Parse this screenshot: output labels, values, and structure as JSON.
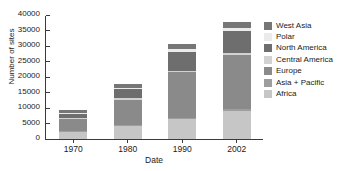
{
  "chart_data": {
    "type": "bar",
    "subtype": "stacked-bar",
    "title": "",
    "xlabel": "Date",
    "ylabel": "Number of sites",
    "categories": [
      "1970",
      "1980",
      "1990",
      "2002"
    ],
    "ylim": [
      0,
      40000
    ],
    "yticks": [
      0,
      5000,
      10000,
      15000,
      20000,
      25000,
      30000,
      35000,
      40000
    ],
    "ytick_labels": [
      "0",
      "5000",
      "10000",
      "15000",
      "20000",
      "25000",
      "30000",
      "35000",
      "40000"
    ],
    "grid": false,
    "legend_position": "right",
    "series": [
      {
        "name": "West Asia",
        "color": "#767676",
        "values": [
          900,
          1200,
          1600,
          1900
        ]
      },
      {
        "name": "Polar",
        "color": "#ebebeb",
        "values": [
          400,
          600,
          900,
          1000
        ]
      },
      {
        "name": "North America",
        "color": "#6e6e6e",
        "values": [
          1300,
          2900,
          5900,
          7100
        ]
      },
      {
        "name": "Central America",
        "color": "#d2d2d2",
        "values": [
          300,
          400,
          600,
          800
        ]
      },
      {
        "name": "Europe",
        "color": "#8a8a8a",
        "values": [
          4000,
          8300,
          14600,
          17300
        ]
      },
      {
        "name": "Asia + Pacific",
        "color": "#9e9e9e",
        "values": [
          200,
          300,
          500,
          600
        ]
      },
      {
        "name": "Africa",
        "color": "#c6c6c6",
        "values": [
          2300,
          4100,
          6400,
          9100
        ]
      }
    ],
    "totals": [
      9400,
      17800,
      30500,
      37800
    ]
  },
  "axes": {
    "ylabel": "Number of sites",
    "xlabel": "Date"
  },
  "legend": {
    "items": [
      {
        "label": "West Asia"
      },
      {
        "label": "Polar"
      },
      {
        "label": "North America"
      },
      {
        "label": "Central America"
      },
      {
        "label": "Europe"
      },
      {
        "label": "Asia + Pacific"
      },
      {
        "label": "Africa"
      }
    ]
  }
}
